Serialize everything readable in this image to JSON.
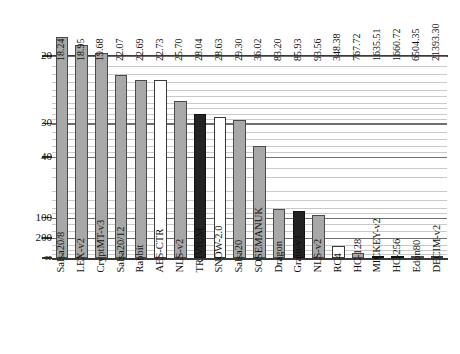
{
  "chart_data": {
    "type": "bar",
    "title": "",
    "subtitle": "",
    "xlabel": "",
    "ylabel": "",
    "orientation": "vertical",
    "y_axis_inverted": true,
    "y_scale": "log-reciprocal",
    "ylim": [
      20,
      "infinity"
    ],
    "grid": true,
    "legend_position": "none",
    "value_label_format": "2-decimal",
    "y_tick_labels": [
      "20",
      "30",
      "40",
      "100",
      "200",
      "∞"
    ],
    "y_tick_values": [
      20,
      30,
      40,
      100,
      200,
      0
    ],
    "categories": [
      "Salsa20/8",
      "LEX-v2",
      "CryptMT-v3",
      "Salsa20/12",
      "Rabbit",
      "AES-CTR",
      "NLS-v2",
      "TRIVIUM",
      "SNOW-2.0",
      "Salsa20",
      "SOSEMANUK",
      "Dragon",
      "Grain-v1",
      "NLS-v2",
      "RC4",
      "HC-128",
      "MICKEY-v2",
      "HC-256",
      "Edon80",
      "DECIM-v2"
    ],
    "values": [
      18.24,
      18.95,
      19.68,
      22.07,
      22.69,
      22.73,
      25.7,
      28.04,
      28.63,
      29.3,
      36.02,
      83.2,
      85.93,
      93.56,
      348.38,
      767.72,
      1635.51,
      1660.72,
      6504.35,
      21393.3
    ],
    "value_labels": [
      "18.24",
      "18.95",
      "19.68",
      "22.07",
      "22.69",
      "22.73",
      "25.70",
      "28.04",
      "28.63",
      "29.30",
      "36.02",
      "83.20",
      "85.93",
      "93.56",
      "348.38",
      "767.72",
      "1635.51",
      "1660.72",
      "6504.35",
      "21393.30"
    ],
    "bar_styles": [
      "gray",
      "gray",
      "gray",
      "gray",
      "gray",
      "white",
      "gray",
      "black",
      "white",
      "gray",
      "gray",
      "gray",
      "black",
      "gray",
      "white",
      "gray",
      "black",
      "black",
      "gray",
      "white"
    ],
    "colors": {
      "gray": "#a8a8a8",
      "white": "#ffffff",
      "black": "#232323",
      "outline": "#3a3a3a",
      "gridline": "#c9c9c9",
      "gridline_major": "#6e6e6e",
      "axis": "#3a3a3a",
      "text": "#111111",
      "background": "#ffffff"
    }
  }
}
